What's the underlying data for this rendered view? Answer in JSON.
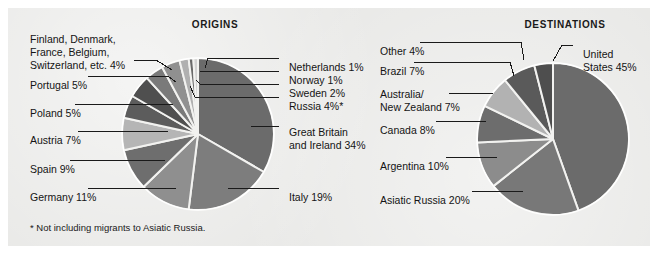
{
  "figure": {
    "background_color": "#ffffff",
    "panel_color": "#e8e8e6",
    "footnote": "* Not including migrants to Asiatic Russia."
  },
  "charts": {
    "origins": {
      "title": "ORIGINS",
      "labels": {
        "netherlands": "Netherlands 1%",
        "norway": "Norway 1%",
        "sweden": "Sweden 2%",
        "russia": "Russia 4%*",
        "great_britain": "Great Britain",
        "great_britain2": "and Ireland 34%",
        "italy": "Italy 19%",
        "germany": "Germany 11%",
        "spain": "Spain 9%",
        "austria": "Austria 7%",
        "poland": "Poland 5%",
        "portugal": "Portugal 5%",
        "other1": "Finland, Denmark,",
        "other2": "France, Belgium,",
        "other3": "Switzerland, etc. 4%"
      }
    },
    "destinations": {
      "title": "DESTINATIONS",
      "labels": {
        "united_states": "United",
        "united_states2": "States 45%",
        "asiatic_russia": "Asiatic Russia 20%",
        "argentina": "Argentina 10%",
        "canada": "Canada 8%",
        "australia_nz": "Australia/",
        "australia_nz2": "New Zealand 7%",
        "brazil": "Brazil 7%",
        "other": "Other 4%"
      }
    }
  },
  "chart_data": [
    {
      "type": "pie",
      "title": "ORIGINS",
      "id": "origins",
      "footnote": "* Not including migrants to Asiatic Russia.",
      "legend_position": "callout-labels",
      "unit": "percent",
      "total": 100,
      "categories": [
        "Great Britain and Ireland",
        "Italy",
        "Germany",
        "Spain",
        "Austria",
        "Poland",
        "Portugal",
        "Finland, Denmark, France, Belgium, Switzerland, etc.",
        "Russia",
        "Sweden",
        "Norway",
        "Netherlands"
      ],
      "values": [
        34,
        19,
        11,
        9,
        7,
        5,
        5,
        4,
        4,
        2,
        1,
        1
      ],
      "labels": [
        "Great Britain and Ireland 34%",
        "Italy 19%",
        "Germany 11%",
        "Spain 9%",
        "Austria 7%",
        "Poland 5%",
        "Portugal 5%",
        "Finland, Denmark, France, Belgium, Switzerland, etc. 4%",
        "Russia 4%*",
        "Sweden 2%",
        "Norway 1%",
        "Netherlands 1%"
      ],
      "colors": [
        "#6b6b6b",
        "#7d7d7d",
        "#8f8f8f",
        "#6e6e6e",
        "#b5b5b5",
        "#5c5c5c",
        "#4f4f4f",
        "#7a7a7a",
        "#909090",
        "#b0b0b0",
        "#6a6a6a",
        "#d2d2d2"
      ],
      "start_angle_deg": -90,
      "direction": "clockwise"
    },
    {
      "type": "pie",
      "title": "DESTINATIONS",
      "id": "destinations",
      "legend_position": "callout-labels",
      "unit": "percent",
      "total": 101,
      "categories": [
        "United States",
        "Asiatic Russia",
        "Argentina",
        "Canada",
        "Australia/New Zealand",
        "Brazil",
        "Other"
      ],
      "values": [
        45,
        20,
        10,
        8,
        7,
        7,
        4
      ],
      "labels": [
        "United States 45%",
        "Asiatic Russia 20%",
        "Argentina 10%",
        "Canada 8%",
        "Australia/New Zealand 7%",
        "Brazil 7%",
        "Other 4%"
      ],
      "colors": [
        "#6b6b6b",
        "#787878",
        "#8c8c8c",
        "#6d6d6d",
        "#b2b2b2",
        "#5a5a5a",
        "#4e4e4e"
      ],
      "start_angle_deg": -90,
      "direction": "clockwise"
    }
  ]
}
